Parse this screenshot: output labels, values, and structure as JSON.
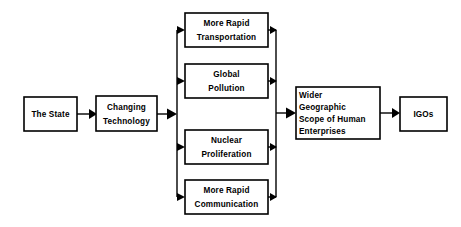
{
  "diagram": {
    "background_color": "#ffffff",
    "line_color": "#000000",
    "node_fill": "#ffffff",
    "nodes": {
      "state": {
        "id": "the-state",
        "lines": [
          "The State"
        ],
        "x": 24,
        "y": 97,
        "w": 53,
        "h": 34,
        "align": "center"
      },
      "changing_technology": {
        "id": "changing-technology",
        "lines": [
          "Changing",
          "Technology"
        ],
        "x": 96,
        "y": 96,
        "w": 61,
        "h": 35,
        "align": "center"
      },
      "more_rapid_transportation": {
        "id": "more-rapid-transportation",
        "lines": [
          "More Rapid",
          "Transportation"
        ],
        "x": 185,
        "y": 13,
        "w": 83,
        "h": 34,
        "align": "center"
      },
      "global_pollution": {
        "id": "global-pollution",
        "lines": [
          "Global",
          "Pollution"
        ],
        "x": 185,
        "y": 64,
        "w": 83,
        "h": 34,
        "align": "center"
      },
      "nuclear_proliferation": {
        "id": "nuclear-proliferation",
        "lines": [
          "Nuclear",
          "Proliferation"
        ],
        "x": 185,
        "y": 130,
        "w": 83,
        "h": 34,
        "align": "center"
      },
      "more_rapid_communication": {
        "id": "more-rapid-communication",
        "lines": [
          "More Rapid",
          "Communication"
        ],
        "x": 185,
        "y": 180,
        "w": 83,
        "h": 34,
        "align": "center"
      },
      "wider_geographic_scope": {
        "id": "wider-geographic-scope-of-human-enterprises",
        "lines": [
          "Wider",
          "Geographic",
          "Scope of Human",
          "Enterprises"
        ],
        "x": 296,
        "y": 87,
        "w": 84,
        "h": 52,
        "align": "left"
      },
      "igos": {
        "id": "igos",
        "lines": [
          "IGOs"
        ],
        "x": 400,
        "y": 97,
        "w": 47,
        "h": 34,
        "align": "center"
      }
    },
    "buses": {
      "left_bus_x": 177,
      "right_bus_x": 276,
      "bus_top_y": 30,
      "bus_bottom_y": 197
    },
    "edges": [
      {
        "id": "state-to-changing-technology",
        "from": "the-state",
        "to": "changing-technology"
      },
      {
        "id": "changing-technology-to-left-bus",
        "from": "changing-technology",
        "to": "left-bus"
      },
      {
        "id": "left-bus-to-more-rapid-transportation",
        "from": "left-bus",
        "to": "more-rapid-transportation"
      },
      {
        "id": "left-bus-to-global-pollution",
        "from": "left-bus",
        "to": "global-pollution"
      },
      {
        "id": "left-bus-to-nuclear-proliferation",
        "from": "left-bus",
        "to": "nuclear-proliferation"
      },
      {
        "id": "left-bus-to-more-rapid-communication",
        "from": "left-bus",
        "to": "more-rapid-communication"
      },
      {
        "id": "more-rapid-transportation-to-right-bus",
        "from": "more-rapid-transportation",
        "to": "right-bus"
      },
      {
        "id": "global-pollution-to-right-bus",
        "from": "global-pollution",
        "to": "right-bus"
      },
      {
        "id": "nuclear-proliferation-to-right-bus",
        "from": "nuclear-proliferation",
        "to": "right-bus"
      },
      {
        "id": "more-rapid-communication-to-right-bus",
        "from": "more-rapid-communication",
        "to": "right-bus"
      },
      {
        "id": "right-bus-to-wider-geographic-scope",
        "from": "right-bus",
        "to": "wider-geographic-scope-of-human-enterprises"
      },
      {
        "id": "wider-geographic-scope-to-igos",
        "from": "wider-geographic-scope-of-human-enterprises",
        "to": "igos"
      }
    ]
  }
}
